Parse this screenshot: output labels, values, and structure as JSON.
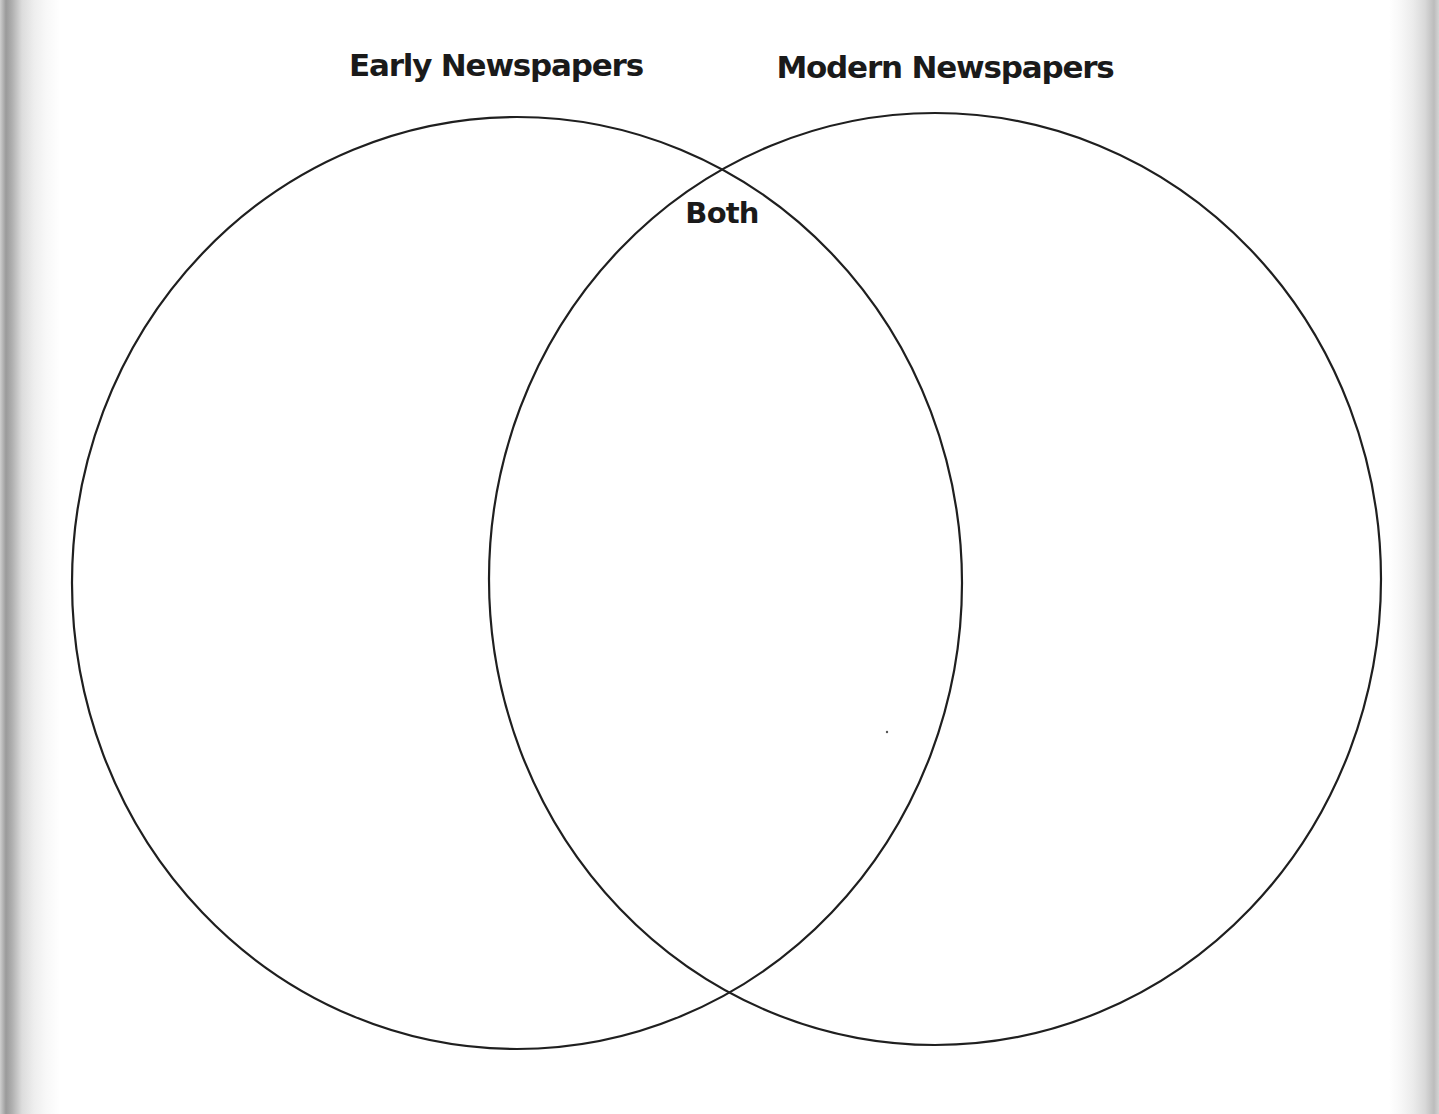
{
  "diagram": {
    "type": "venn",
    "sets": [
      {
        "id": "early",
        "label": "Early Newspapers",
        "cx": 517,
        "cy": 583,
        "rx": 445,
        "ry": 466
      },
      {
        "id": "modern",
        "label": "Modern Newspapers",
        "cx": 935,
        "cy": 579,
        "rx": 446,
        "ry": 466
      }
    ],
    "intersection_label": "Both",
    "stroke_color": "#1f1f1f",
    "background_color": "#ffffff"
  },
  "labels": {
    "left_title": "Early Newspapers",
    "right_title": "Modern Newspapers",
    "overlap": "Both"
  },
  "regions": {
    "left_only": "",
    "both": "",
    "right_only": ""
  }
}
